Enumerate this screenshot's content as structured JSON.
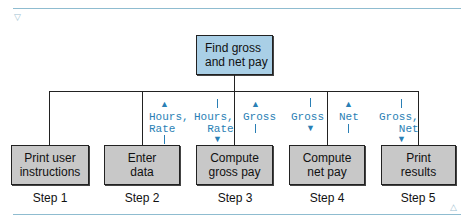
{
  "root": {
    "label_line1": "Find gross",
    "label_line2": "and net pay"
  },
  "modules": [
    {
      "line1": "Print user",
      "line2": "instructions",
      "step": "Step 1"
    },
    {
      "line1": "Enter",
      "line2": "data",
      "step": "Step 2"
    },
    {
      "line1": "Compute",
      "line2": "gross pay",
      "step": "Step 3"
    },
    {
      "line1": "Compute",
      "line2": "net pay",
      "step": "Step 4"
    },
    {
      "line1": "Print",
      "line2": "results",
      "step": "Step 5"
    }
  ],
  "flows": [
    {
      "text": "Hours,\nRate",
      "direction": "up",
      "module": "Enter data"
    },
    {
      "text": "Hours,\nRate",
      "direction": "down",
      "module": "Compute gross pay"
    },
    {
      "text": "Gross",
      "direction": "up",
      "module": "Compute gross pay"
    },
    {
      "text": "Gross",
      "direction": "down",
      "module": "Compute net pay"
    },
    {
      "text": "Net",
      "direction": "up",
      "module": "Compute net pay"
    },
    {
      "text": "Gross,\nNet",
      "direction": "down",
      "module": "Print results"
    }
  ],
  "colors": {
    "root_fill": "#a9cfe6",
    "module_fill": "#c8c8c8",
    "flow_text": "#2a7fb5",
    "rule": "#8fbcd0"
  },
  "decor": {
    "top_marker": "▽",
    "bottom_marker": "△"
  }
}
